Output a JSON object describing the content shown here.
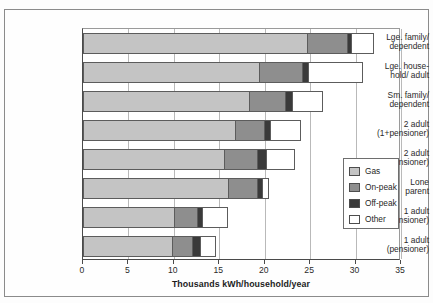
{
  "chart_data": {
    "type": "bar",
    "orientation": "horizontal",
    "stacked": true,
    "title": "",
    "xlabel": "Thousands kWh/household/year",
    "ylabel": "",
    "xlim": [
      0,
      35
    ],
    "xticks": [
      0,
      5,
      10,
      15,
      20,
      25,
      30,
      35
    ],
    "xtick_labels": [
      "0",
      "5",
      "10",
      "15",
      "20",
      "25",
      "30",
      "35"
    ],
    "grid": true,
    "grid_axis": "x",
    "legend_position": "right",
    "categories": [
      "Lge. family/ dependent",
      "Lge. house-hold/ adult",
      "Sm. family/ dependent",
      "2 adult (1+pensioner)",
      "2 adult (not pensioner)",
      "Lone parent",
      "1 adult (not pensioner)",
      "1 adult (pensioner)"
    ],
    "category_lines": [
      [
        "Lge. family/",
        "dependent"
      ],
      [
        "Lge. house-",
        "hold/ adult"
      ],
      [
        "Sm. family/",
        "dependent"
      ],
      [
        "2 adult",
        "(1+pensioner)"
      ],
      [
        "2 adult",
        "(not pensioner)"
      ],
      [
        "Lone",
        "parent"
      ],
      [
        "1 adult",
        "(not pensioner)"
      ],
      [
        "1 adult",
        "(pensioner)"
      ]
    ],
    "series": [
      {
        "name": "Gas",
        "color": "#c4c4c4",
        "values": [
          24.8,
          19.5,
          18.4,
          16.8,
          15.6,
          16.1,
          10.1,
          9.9
        ]
      },
      {
        "name": "On-peak",
        "color": "#8e8e8e",
        "values": [
          4.5,
          4.8,
          4.1,
          3.3,
          3.8,
          3.3,
          2.7,
          2.3
        ]
      },
      {
        "name": "Off-peak",
        "color": "#3a3a3a",
        "values": [
          0.5,
          0.8,
          0.8,
          0.8,
          1.1,
          0.6,
          0.6,
          1.0
        ]
      },
      {
        "name": "Other",
        "color": "#ffffff",
        "values": [
          2.6,
          6.0,
          3.5,
          3.4,
          3.2,
          0.8,
          2.9,
          1.8
        ]
      }
    ],
    "totals": [
      32.4,
      31.1,
      26.8,
      24.3,
      23.7,
      20.8,
      16.3,
      15.0
    ]
  },
  "legend": {
    "items": [
      {
        "label": "Gas",
        "color": "#c4c4c4"
      },
      {
        "label": "On-peak",
        "color": "#8e8e8e"
      },
      {
        "label": "Off-peak",
        "color": "#3a3a3a"
      },
      {
        "label": "Other",
        "color": "#ffffff"
      }
    ]
  }
}
